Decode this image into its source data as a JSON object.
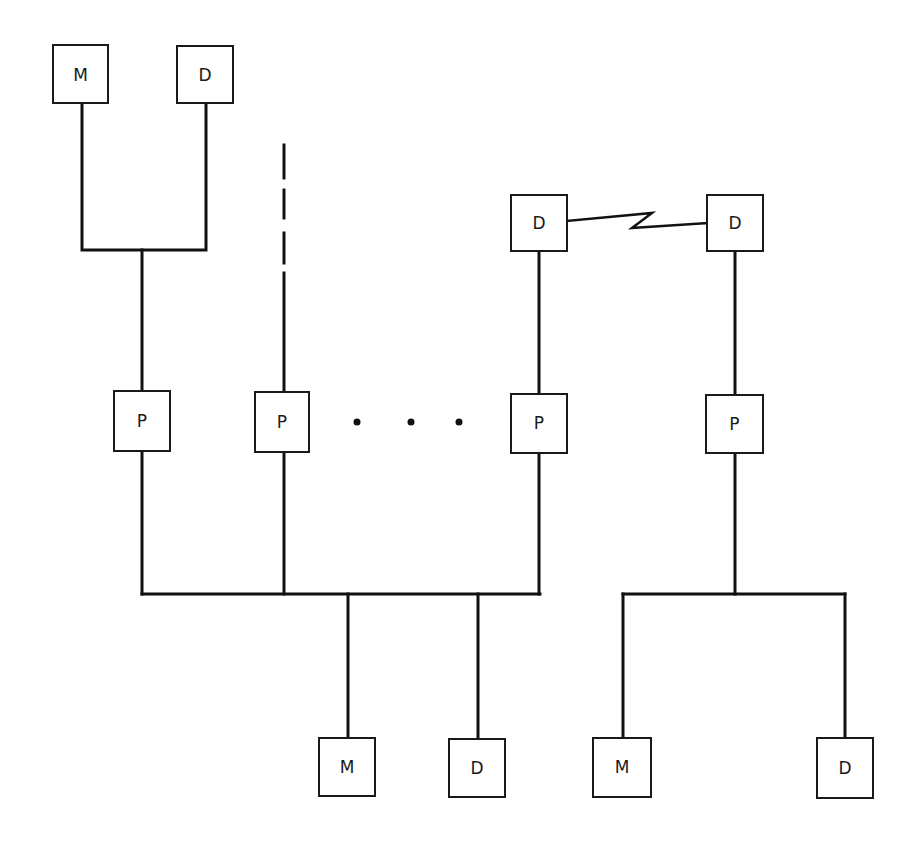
{
  "diagram": {
    "title": "",
    "nodes": [
      {
        "id": "top-m",
        "label": "M",
        "kind": "memory"
      },
      {
        "id": "top-d",
        "label": "D",
        "kind": "device"
      },
      {
        "id": "p1",
        "label": "P",
        "kind": "processor"
      },
      {
        "id": "p2",
        "label": "P",
        "kind": "processor"
      },
      {
        "id": "d-left",
        "label": "D",
        "kind": "device"
      },
      {
        "id": "d-right",
        "label": "D",
        "kind": "device"
      },
      {
        "id": "p3",
        "label": "P",
        "kind": "processor"
      },
      {
        "id": "p4",
        "label": "P",
        "kind": "processor"
      },
      {
        "id": "bottom-m1",
        "label": "M",
        "kind": "memory"
      },
      {
        "id": "bottom-d1",
        "label": "D",
        "kind": "device"
      },
      {
        "id": "bottom-m2",
        "label": "M",
        "kind": "memory"
      },
      {
        "id": "bottom-d2",
        "label": "D",
        "kind": "device"
      }
    ],
    "edges": [
      {
        "from": "top-m",
        "to": "p1",
        "style": "solid"
      },
      {
        "from": "top-d",
        "to": "p1",
        "style": "solid"
      },
      {
        "from": "external",
        "to": "p2",
        "style": "dashed"
      },
      {
        "from": "d-left",
        "to": "d-right",
        "style": "communication-link"
      },
      {
        "from": "d-left",
        "to": "p3",
        "style": "solid"
      },
      {
        "from": "d-right",
        "to": "p4",
        "style": "solid"
      },
      {
        "from": "p1",
        "to": "shared-bus",
        "style": "solid"
      },
      {
        "from": "p2",
        "to": "shared-bus",
        "style": "solid"
      },
      {
        "from": "p3",
        "to": "shared-bus",
        "style": "solid"
      },
      {
        "from": "shared-bus",
        "to": "bottom-m1",
        "style": "solid"
      },
      {
        "from": "shared-bus",
        "to": "bottom-d1",
        "style": "solid"
      },
      {
        "from": "p4",
        "to": "bottom-m2",
        "style": "solid"
      },
      {
        "from": "p4",
        "to": "bottom-d2",
        "style": "solid"
      }
    ],
    "ellipsis": "…"
  }
}
